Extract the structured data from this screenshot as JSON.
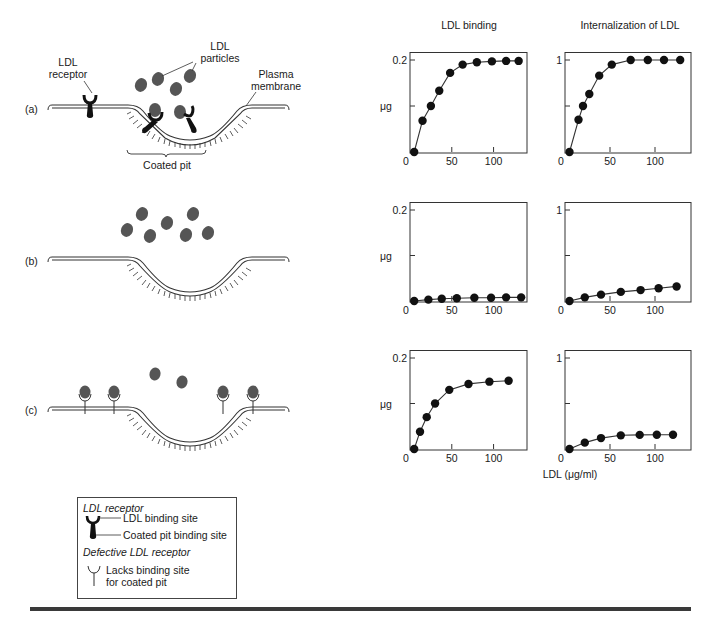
{
  "diagram": {
    "panels": [
      {
        "label": "(a)",
        "description": "Normal LDL receptor: binds LDL and clusters in coated pit"
      },
      {
        "label": "(b)",
        "description": "No LDL receptors: LDL particles do not bind"
      },
      {
        "label": "(c)",
        "description": "Defective LDL receptor: binds LDL but lacks coated pit binding site"
      }
    ],
    "annotations": {
      "ldl_receptor": "LDL receptor",
      "ldl_receptor_line1": "LDL",
      "ldl_receptor_line2": "receptor",
      "ldl_particles_line1": "LDL",
      "ldl_particles_line2": "particles",
      "plasma_membrane_line1": "Plasma",
      "plasma_membrane_line2": "membrane",
      "coated_pit": "Coated pit"
    },
    "legend": {
      "title1": "LDL receptor",
      "item1": "LDL binding site",
      "item2": "Coated pit binding site",
      "title2": "Defective LDL receptor",
      "item3_line1": "Lacks binding site",
      "item3_line2": "for coated pit"
    }
  },
  "charts_header": {
    "col1_title": "LDL binding",
    "col2_title": "Internalization of LDL",
    "ylabel": "μg",
    "xlabel": "LDL (μg/ml)"
  },
  "chart_data": [
    {
      "type": "line",
      "panel": "(a)",
      "title": "LDL binding",
      "xlabel": "LDL (μg/ml)",
      "ylabel": "μg",
      "x": [
        5,
        15,
        25,
        35,
        48,
        63,
        80,
        98,
        115,
        130
      ],
      "values": [
        0.0,
        0.068,
        0.1,
        0.133,
        0.172,
        0.19,
        0.195,
        0.197,
        0.198,
        0.198
      ],
      "xticks": [
        "0",
        "50",
        "100"
      ],
      "yticks": [
        "0.2"
      ],
      "ylim": [
        0,
        0.2
      ],
      "xlim": [
        0,
        140
      ],
      "grid": false
    },
    {
      "type": "line",
      "panel": "(a)",
      "title": "Internalization of LDL",
      "xlabel": "LDL (μg/ml)",
      "ylabel": "μg",
      "x": [
        5,
        15,
        20,
        27,
        38,
        52,
        73,
        92,
        110,
        128
      ],
      "values": [
        0.0,
        0.35,
        0.5,
        0.63,
        0.83,
        0.95,
        1.0,
        1.0,
        1.0,
        1.0
      ],
      "xticks": [
        "0",
        "50",
        "100"
      ],
      "yticks": [
        "1"
      ],
      "ylim": [
        0,
        1
      ],
      "xlim": [
        0,
        140
      ],
      "grid": false
    },
    {
      "type": "line",
      "panel": "(b)",
      "title": "LDL binding",
      "xlabel": "LDL (μg/ml)",
      "ylabel": "μg",
      "x": [
        5,
        22,
        38,
        56,
        77,
        97,
        115,
        133
      ],
      "values": [
        0.0,
        0.003,
        0.005,
        0.006,
        0.007,
        0.007,
        0.008,
        0.008
      ],
      "xticks": [
        "0",
        "50",
        "100"
      ],
      "yticks": [
        "0.2"
      ],
      "ylim": [
        0,
        0.2
      ],
      "xlim": [
        0,
        140
      ],
      "grid": false
    },
    {
      "type": "line",
      "panel": "(b)",
      "title": "Internalization of LDL",
      "xlabel": "LDL (μg/ml)",
      "ylabel": "μg",
      "x": [
        5,
        22,
        40,
        62,
        84,
        104,
        124
      ],
      "values": [
        0.0,
        0.04,
        0.07,
        0.1,
        0.12,
        0.14,
        0.16
      ],
      "xticks": [
        "0",
        "50",
        "100"
      ],
      "yticks": [
        "1"
      ],
      "ylim": [
        0,
        1
      ],
      "xlim": [
        0,
        140
      ],
      "grid": false
    },
    {
      "type": "line",
      "panel": "(c)",
      "title": "LDL binding",
      "xlabel": "LDL (μg/ml)",
      "ylabel": "μg",
      "x": [
        5,
        12,
        20,
        30,
        47,
        70,
        95,
        118
      ],
      "values": [
        0.0,
        0.038,
        0.07,
        0.1,
        0.13,
        0.143,
        0.148,
        0.15
      ],
      "xticks": [
        "0",
        "50",
        "100"
      ],
      "yticks": [
        "0.2"
      ],
      "ylim": [
        0,
        0.2
      ],
      "xlim": [
        0,
        140
      ],
      "grid": false
    },
    {
      "type": "line",
      "panel": "(c)",
      "title": "Internalization of LDL",
      "xlabel": "LDL (μg/ml)",
      "ylabel": "μg",
      "x": [
        5,
        22,
        40,
        62,
        83,
        102,
        120
      ],
      "values": [
        0.0,
        0.07,
        0.12,
        0.15,
        0.155,
        0.157,
        0.157
      ],
      "xticks": [
        "0",
        "50",
        "100"
      ],
      "yticks": [
        "1"
      ],
      "ylim": [
        0,
        1
      ],
      "xlim": [
        0,
        140
      ],
      "grid": false
    }
  ]
}
